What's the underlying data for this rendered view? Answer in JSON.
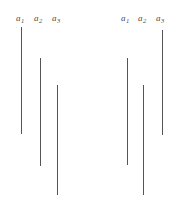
{
  "figure": {
    "type": "line-segment-comparison-diagram",
    "background_color": "#ffffff",
    "line_color": "#555555",
    "label_color": "#4a4a4a",
    "width": 178,
    "height": 212
  },
  "groups": [
    {
      "name": "left-group",
      "labels": [
        {
          "base": "a",
          "sub": "1",
          "x": 16,
          "y": 14
        },
        {
          "base": "a",
          "sub": "2",
          "x": 34,
          "y": 14
        },
        {
          "base": "a",
          "sub": "3",
          "x": 52,
          "y": 14
        }
      ],
      "segments": [
        {
          "name": "a1",
          "x": 21,
          "top": 27,
          "bottom": 134,
          "length": 107
        },
        {
          "name": "a2",
          "x": 40,
          "top": 58,
          "bottom": 166,
          "length": 108
        },
        {
          "name": "a3",
          "x": 57,
          "top": 85,
          "bottom": 195,
          "length": 110
        }
      ]
    },
    {
      "name": "right-group",
      "labels": [
        {
          "base": "a",
          "sub": "1",
          "x": 121,
          "y": 14
        },
        {
          "base": "a",
          "sub": "2",
          "x": 138,
          "y": 14
        },
        {
          "base": "a",
          "sub": "3",
          "x": 156,
          "y": 14
        }
      ],
      "segments": [
        {
          "name": "a1",
          "x": 127,
          "top": 58,
          "bottom": 165,
          "length": 107
        },
        {
          "name": "a2",
          "x": 143,
          "top": 85,
          "bottom": 195,
          "length": 110
        },
        {
          "name": "a3",
          "x": 162,
          "top": 30,
          "bottom": 135,
          "length": 105
        }
      ]
    }
  ],
  "chart_data": {
    "type": "bar",
    "title": "",
    "xlabel": "",
    "ylabel": "",
    "orientation": "vertical-segments",
    "categories": [
      "a1",
      "a2",
      "a3"
    ],
    "series": [
      {
        "name": "left-group",
        "values": [
          107,
          108,
          110
        ],
        "tops": [
          27,
          58,
          85
        ],
        "bottoms": [
          134,
          166,
          195
        ]
      },
      {
        "name": "right-group",
        "values": [
          107,
          110,
          105
        ],
        "tops": [
          58,
          85,
          30
        ],
        "bottoms": [
          165,
          195,
          135
        ]
      }
    ],
    "grid": false,
    "legend": "none",
    "ylim": [
      0,
      212
    ]
  }
}
